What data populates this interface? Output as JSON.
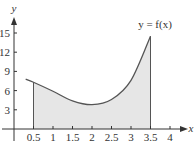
{
  "chart_data": {
    "type": "area",
    "title": "",
    "curve_label": "y = f(x)",
    "xlabel": "x",
    "ylabel": "y",
    "xlim": [
      0,
      4.2
    ],
    "ylim": [
      0,
      17
    ],
    "x_ticks": [
      "0.5",
      "1",
      "1.5",
      "2",
      "2.5",
      "3",
      "3.5",
      "4"
    ],
    "y_ticks": [
      "3",
      "6",
      "9",
      "12",
      "15"
    ],
    "grid": false,
    "shaded_region": {
      "from": 0.5,
      "to": 3.5,
      "color": "#e6e6e6"
    },
    "series": [
      {
        "name": "f(x)",
        "x": [
          0.3,
          0.5,
          1.0,
          1.5,
          2.0,
          2.5,
          3.0,
          3.5
        ],
        "values": [
          7.8,
          7.3,
          5.9,
          4.4,
          3.8,
          4.6,
          7.6,
          14.5
        ]
      }
    ],
    "colors": {
      "curve": "#555555",
      "fill": "#e6e6e6",
      "axis": "#333333"
    }
  }
}
